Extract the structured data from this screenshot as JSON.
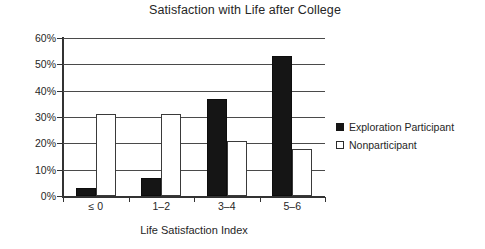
{
  "chart_data": {
    "type": "bar",
    "title": "Satisfaction with Life after College",
    "xlabel": "Life Satisfaction Index",
    "ylabel": "",
    "categories": [
      "≤ 0",
      "1–2",
      "3–4",
      "5–6"
    ],
    "series": [
      {
        "name": "Exploration Participant",
        "marker": "filled-square",
        "color": "#151515",
        "values": [
          3,
          7,
          37,
          53
        ]
      },
      {
        "name": "Nonparticipant",
        "marker": "hollow-square",
        "color": "#ffffff",
        "values": [
          31,
          31,
          21,
          18
        ]
      }
    ],
    "ylim": [
      0,
      60
    ],
    "ytick_labels": [
      "60%",
      "50%",
      "40%",
      "30%",
      "20%",
      "10%",
      "0%"
    ],
    "ytick_values": [
      60,
      50,
      40,
      30,
      20,
      10,
      0
    ],
    "grid": "horizontal",
    "legend_position": "right",
    "value_suffix": "%"
  }
}
